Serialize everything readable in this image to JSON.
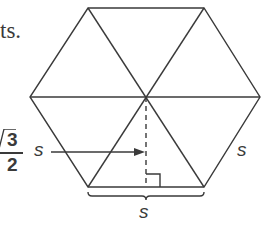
{
  "fragment_text": "ts.",
  "labels": {
    "apothem_numerator": "3",
    "apothem_denominator": "2",
    "apothem_variable": "s",
    "side_label_right": "s",
    "side_label_bottom": "s"
  },
  "colors": {
    "stroke": "#3a3a3a",
    "background": "#ffffff"
  }
}
